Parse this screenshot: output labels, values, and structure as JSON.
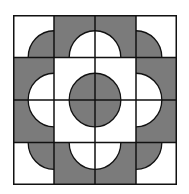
{
  "figure": {
    "title": "",
    "grid": {
      "rows": 4,
      "cols": 4
    },
    "colors": {
      "dark": "#7b7b7b",
      "light": "#ffffff",
      "line": "#111111"
    },
    "radius_ratio": 0.63,
    "cells": [
      [
        {
          "bg": "light",
          "corner": "br"
        },
        {
          "bg": "dark",
          "corner": "br"
        },
        {
          "bg": "dark",
          "corner": "bl"
        },
        {
          "bg": "light",
          "corner": "bl"
        }
      ],
      [
        {
          "bg": "dark",
          "corner": "br"
        },
        {
          "bg": "light",
          "corner": "br"
        },
        {
          "bg": "light",
          "corner": "bl"
        },
        {
          "bg": "dark",
          "corner": "bl"
        }
      ],
      [
        {
          "bg": "dark",
          "corner": "tr"
        },
        {
          "bg": "light",
          "corner": "tr"
        },
        {
          "bg": "light",
          "corner": "tl"
        },
        {
          "bg": "dark",
          "corner": "tl"
        }
      ],
      [
        {
          "bg": "light",
          "corner": "tr"
        },
        {
          "bg": "dark",
          "corner": "tr"
        },
        {
          "bg": "dark",
          "corner": "tl"
        },
        {
          "bg": "light",
          "corner": "tl"
        }
      ]
    ]
  }
}
